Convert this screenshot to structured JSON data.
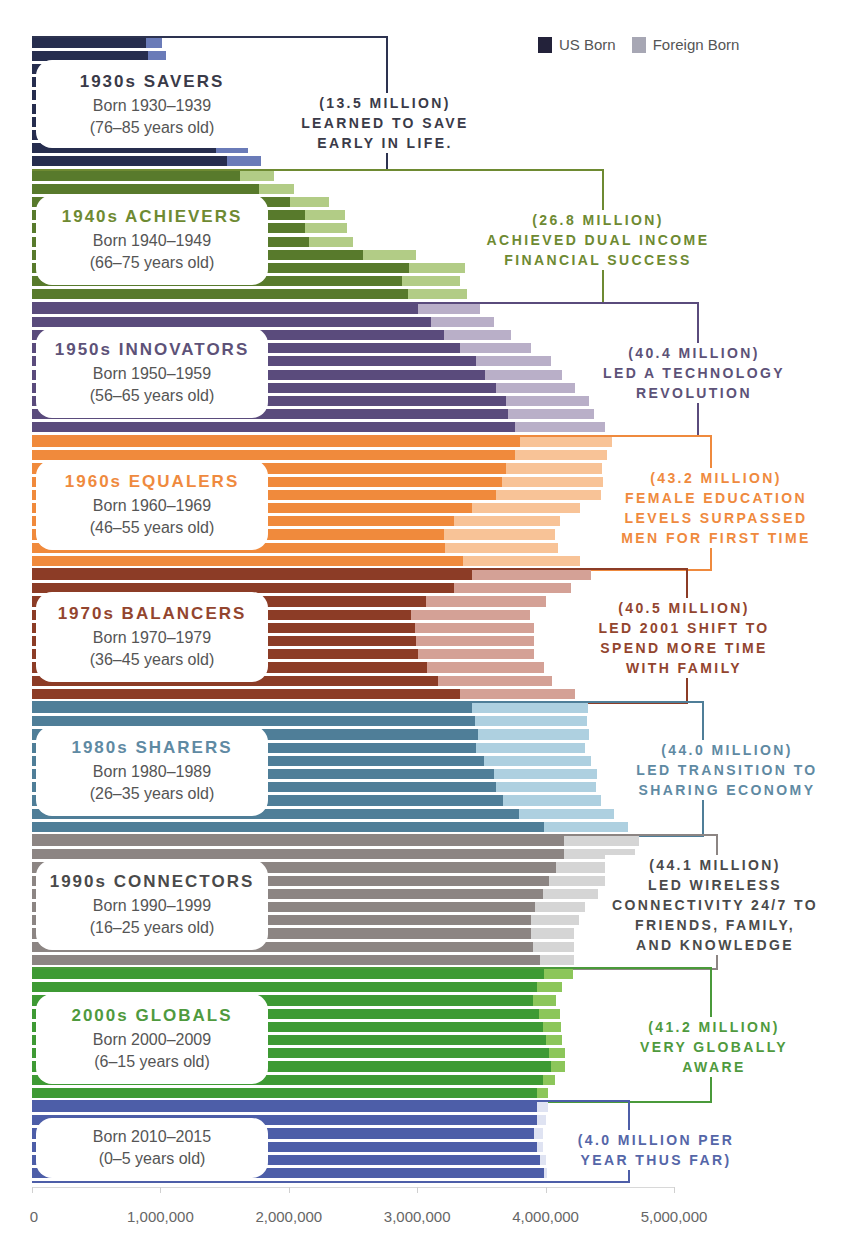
{
  "legend": {
    "items": [
      {
        "label": "US Born",
        "color": "#23223a"
      },
      {
        "label": "Foreign Born",
        "color": "#a7a7b4"
      }
    ]
  },
  "axis": {
    "ticks": [
      "0",
      "1,000,000",
      "2,000,000",
      "3,000,000",
      "4,000,000",
      "5,000,000"
    ],
    "tick_values": [
      0,
      1000000,
      2000000,
      3000000,
      4000000,
      5000000
    ]
  },
  "groups": [
    {
      "title": "1930s SAVERS",
      "born": "Born 1930–1939",
      "age": "(76–85 years old)",
      "annotation": [
        "(13.5 MILLION)",
        "LEARNED TO SAVE",
        "EARLY IN LIFE."
      ],
      "us_color": "#262d4e",
      "fb_color": "#6a7bb8",
      "text_color": "#3a3a48",
      "line_color": "#2d3350"
    },
    {
      "title": "1940s ACHIEVERS",
      "born": "Born 1940–1949",
      "age": "(66–75 years old)",
      "annotation": [
        "(26.8 MILLION)",
        "ACHIEVED DUAL INCOME",
        "FINANCIAL SUCCESS"
      ],
      "us_color": "#587a2c",
      "fb_color": "#b2cc86",
      "text_color": "#6e8a32",
      "line_color": "#6e8a32"
    },
    {
      "title": "1950s INNOVATORS",
      "born": "Born 1950–1959",
      "age": "(56–65 years old)",
      "annotation": [
        "(40.4 MILLION)",
        "LED A TECHNOLOGY",
        "REVOLUTION"
      ],
      "us_color": "#5a4b7c",
      "fb_color": "#b9afc8",
      "text_color": "#5d5278",
      "line_color": "#5a4b7c"
    },
    {
      "title": "1960s EQUALERS",
      "born": "Born 1960–1969",
      "age": "(46–55 years old)",
      "annotation": [
        "(43.2 MILLION)",
        "FEMALE EDUCATION",
        "LEVELS SURPASSED",
        "MEN FOR FIRST TIME"
      ],
      "us_color": "#f08a3c",
      "fb_color": "#f8c397",
      "text_color": "#ef8a3e",
      "line_color": "#ef8a3e"
    },
    {
      "title": "1970s BALANCERS",
      "born": "Born 1970–1979",
      "age": "(36–45 years old)",
      "annotation": [
        "(40.5 MILLION)",
        "LED 2001 SHIFT TO",
        "SPEND MORE TIME",
        "WITH FAMILY"
      ],
      "us_color": "#8c3c26",
      "fb_color": "#d4a196",
      "text_color": "#93452e",
      "line_color": "#8c3c26"
    },
    {
      "title": "1980s SHARERS",
      "born": "Born 1980–1989",
      "age": "(26–35 years old)",
      "annotation": [
        "(44.0 MILLION)",
        "LED TRANSITION TO",
        "SHARING ECONOMY"
      ],
      "us_color": "#4f7e98",
      "fb_color": "#aed0e0",
      "text_color": "#5f8aa3",
      "line_color": "#4f7e98"
    },
    {
      "title": "1990s CONNECTORS",
      "born": "Born 1990–1999",
      "age": "(16–25 years old)",
      "annotation": [
        "(44.1 MILLION)",
        "LED WIRELESS",
        "CONNECTIVITY 24/7 TO",
        "FRIENDS, FAMILY,",
        "AND KNOWLEDGE"
      ],
      "us_color": "#8c8583",
      "fb_color": "#d5d5d5",
      "text_color": "#4a4a4a",
      "line_color": "#8c8583"
    },
    {
      "title": "2000s GLOBALS",
      "born": "Born 2000–2009",
      "age": "(6–15 years old)",
      "annotation": [
        "(41.2 MILLION)",
        "VERY GLOBALLY",
        "AWARE"
      ],
      "us_color": "#3e9a34",
      "fb_color": "#8cc65a",
      "text_color": "#4f9a3e",
      "line_color": "#4a9a3a"
    },
    {
      "title": "",
      "born": "Born 2010–2015",
      "age": "(0–5 years old)",
      "annotation": [
        "(4.0 MILLION PER",
        "YEAR THUS FAR)"
      ],
      "us_color": "#4d5ea8",
      "fb_color": "#dfe3f2",
      "text_color": "#5566a8",
      "line_color": "#4d5ea8"
    }
  ],
  "chart_data": {
    "type": "bar",
    "orientation": "horizontal-stacked",
    "title": "",
    "xlabel": "",
    "ylabel": "",
    "xlim": [
      0,
      5000000
    ],
    "legend_position": "top-right",
    "series": [
      {
        "name": "US Born"
      },
      {
        "name": "Foreign Born"
      }
    ],
    "groups": [
      {
        "name": "1930s SAVERS",
        "total_label": "13.5 MILLION",
        "us": [
          890000,
          905000,
          1000000,
          1100000,
          1200000,
          1300000,
          1350000,
          1440000,
          1430000,
          1520000
        ],
        "foreign": [
          125000,
          140000,
          100000,
          110000,
          110000,
          110000,
          110000,
          120000,
          250000,
          260000
        ]
      },
      {
        "name": "1940s ACHIEVERS",
        "total_label": "26.8 MILLION",
        "us": [
          1620000,
          1770000,
          2010000,
          2130000,
          2130000,
          2160000,
          2580000,
          2940000,
          2880000,
          2930000
        ],
        "foreign": [
          265000,
          270000,
          300000,
          310000,
          320000,
          340000,
          410000,
          430000,
          450000,
          460000
        ]
      },
      {
        "name": "1950s INNOVATORS",
        "total_label": "40.4 MILLION",
        "us": [
          3010000,
          3110000,
          3210000,
          3330000,
          3460000,
          3530000,
          3610000,
          3690000,
          3710000,
          3760000
        ],
        "foreign": [
          480000,
          490000,
          520000,
          560000,
          580000,
          600000,
          620000,
          650000,
          670000,
          700000
        ]
      },
      {
        "name": "1960s EQUALERS",
        "total_label": "43.2 MILLION",
        "us": [
          3800000,
          3760000,
          3690000,
          3660000,
          3610000,
          3430000,
          3290000,
          3210000,
          3220000,
          3360000
        ],
        "foreign": [
          720000,
          720000,
          750000,
          790000,
          820000,
          840000,
          820000,
          860000,
          880000,
          910000
        ]
      },
      {
        "name": "1970s BALANCERS",
        "total_label": "40.5 MILLION",
        "us": [
          3430000,
          3290000,
          3070000,
          2950000,
          2980000,
          2990000,
          3010000,
          3080000,
          3160000,
          3330000
        ],
        "foreign": [
          920000,
          910000,
          930000,
          930000,
          930000,
          920000,
          900000,
          910000,
          890000,
          900000
        ]
      },
      {
        "name": "1980s SHARERS",
        "total_label": "44.0 MILLION",
        "us": [
          3430000,
          3450000,
          3470000,
          3460000,
          3520000,
          3600000,
          3610000,
          3670000,
          3790000,
          3990000
        ],
        "foreign": [
          900000,
          870000,
          870000,
          850000,
          830000,
          800000,
          780000,
          760000,
          740000,
          650000
        ]
      },
      {
        "name": "1990s CONNECTORS",
        "total_label": "44.1 MILLION",
        "us": [
          4140000,
          4140000,
          4080000,
          4030000,
          3980000,
          3920000,
          3890000,
          3890000,
          3900000,
          3960000
        ],
        "foreign": [
          590000,
          560000,
          510000,
          460000,
          430000,
          390000,
          370000,
          330000,
          320000,
          260000
        ]
      },
      {
        "name": "2000s GLOBALS",
        "total_label": "41.2 MILLION",
        "us": [
          3990000,
          3930000,
          3900000,
          3950000,
          3980000,
          4000000,
          4030000,
          4040000,
          3980000,
          3930000
        ],
        "foreign": [
          220000,
          200000,
          180000,
          160000,
          140000,
          130000,
          120000,
          110000,
          90000,
          90000
        ]
      },
      {
        "name": "2010s",
        "total_label": "4.0 MILLION PER YEAR THUS FAR",
        "us": [
          3930000,
          3930000,
          3910000,
          3930000,
          3960000,
          3990000
        ],
        "foreign": [
          90000,
          70000,
          70000,
          50000,
          40000,
          20000
        ]
      }
    ]
  }
}
